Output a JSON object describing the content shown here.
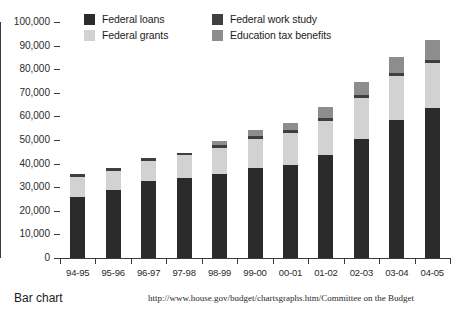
{
  "caption": {
    "left": "Bar chart",
    "right": "http://www.house.gov/budget/chartsgraphs.htm/Committee on the Budget"
  },
  "colors": {
    "federal_loans": "#2b2b2b",
    "federal_grants": "#d2d2d2",
    "federal_work_study": "#3f3f3f",
    "education_tax_benefits": "#8d8d8d",
    "axis": "#3a3a3a",
    "background": "#ffffff"
  },
  "chart_data": {
    "type": "bar",
    "subtype": "stacked-vertical",
    "title": "",
    "xlabel": "",
    "ylabel": "",
    "ylim": [
      0,
      100000
    ],
    "yticks": [
      0,
      10000,
      20000,
      30000,
      40000,
      50000,
      60000,
      70000,
      80000,
      90000,
      100000
    ],
    "ytick_labels": [
      "0",
      "10,000",
      "20,000",
      "30,000",
      "40,000",
      "50,000",
      "60,000",
      "70,000",
      "80,000",
      "90,000",
      "100,000"
    ],
    "grid": false,
    "legend_position": "top-inside",
    "categories": [
      "94-95",
      "95-96",
      "96-97",
      "97-98",
      "98-99",
      "99-00",
      "00-01",
      "01-02",
      "02-03",
      "03-04",
      "04-05"
    ],
    "series": [
      {
        "name": "Federal loans",
        "color": "#2b2b2b",
        "values": [
          26000,
          29000,
          32500,
          34000,
          35500,
          38000,
          39500,
          43500,
          50500,
          58500,
          63500
        ]
      },
      {
        "name": "Federal grants",
        "color": "#d2d2d2",
        "values": [
          8500,
          8000,
          8500,
          9500,
          11000,
          12500,
          13500,
          14500,
          17500,
          18500,
          19000
        ]
      },
      {
        "name": "Federal work study",
        "color": "#3f3f3f",
        "values": [
          1200,
          1200,
          1200,
          1200,
          1200,
          1200,
          1200,
          1200,
          1200,
          1200,
          1200
        ]
      },
      {
        "name": "Education tax benefits",
        "color": "#8d8d8d",
        "values": [
          0,
          0,
          0,
          0,
          2000,
          2500,
          3000,
          5000,
          5500,
          7000,
          8500
        ]
      }
    ],
    "totals": [
      35700,
      38200,
      42200,
      44700,
      49700,
      54200,
      57200,
      64200,
      74700,
      85200,
      92200
    ]
  },
  "legend": {
    "items": [
      {
        "label": "Federal loans",
        "color": "#2b2b2b"
      },
      {
        "label": "Federal grants",
        "color": "#d2d2d2"
      },
      {
        "label": "Federal work study",
        "color": "#3f3f3f"
      },
      {
        "label": "Education tax benefits",
        "color": "#8d8d8d"
      }
    ]
  }
}
